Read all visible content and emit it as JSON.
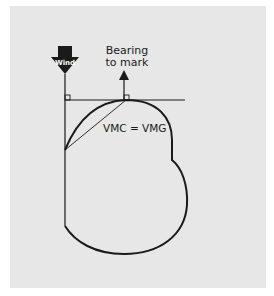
{
  "diagram": {
    "wind_label": "Wind",
    "bearing_label_line1": "Bearing",
    "bearing_label_line2": "to mark",
    "vmc_label": "VMC = VMG",
    "colors": {
      "panel": "#e7e7e7",
      "ink": "#1a1a1a",
      "arrow_text": "#ffffff"
    }
  }
}
